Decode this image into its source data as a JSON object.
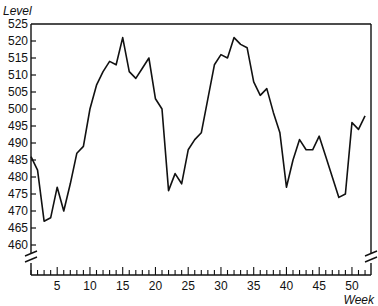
{
  "chart_data": {
    "type": "line",
    "title": "",
    "xlabel": "Week",
    "ylabel": "Level",
    "xlim": [
      1,
      52
    ],
    "ylim": [
      455,
      525
    ],
    "y_axis_break": true,
    "x_axis_break": true,
    "grid": false,
    "legend": null,
    "x_ticks": [
      5,
      10,
      15,
      20,
      25,
      30,
      35,
      40,
      45,
      50
    ],
    "y_ticks": [
      460,
      465,
      470,
      475,
      480,
      485,
      490,
      495,
      500,
      505,
      510,
      515,
      520,
      525
    ],
    "x": [
      1,
      2,
      3,
      4,
      5,
      6,
      7,
      8,
      9,
      10,
      11,
      12,
      13,
      14,
      15,
      16,
      17,
      18,
      19,
      20,
      21,
      22,
      23,
      24,
      25,
      26,
      27,
      28,
      29,
      30,
      31,
      32,
      33,
      34,
      35,
      36,
      37,
      38,
      39,
      40,
      41,
      42,
      43,
      44,
      45,
      46,
      47,
      48,
      49,
      50,
      51,
      52
    ],
    "series": [
      {
        "name": "Level",
        "values": [
          486,
          482,
          467,
          468,
          477,
          470,
          478,
          487,
          489,
          500,
          507,
          511,
          514,
          513,
          521,
          511,
          509,
          512,
          515,
          503,
          500,
          476,
          481,
          478,
          488,
          491,
          493,
          503,
          513,
          516,
          515,
          521,
          519,
          518,
          508,
          504,
          506,
          499,
          493,
          477,
          485,
          491,
          488,
          488,
          492,
          486,
          480,
          474,
          475,
          496,
          494,
          498
        ]
      }
    ]
  }
}
